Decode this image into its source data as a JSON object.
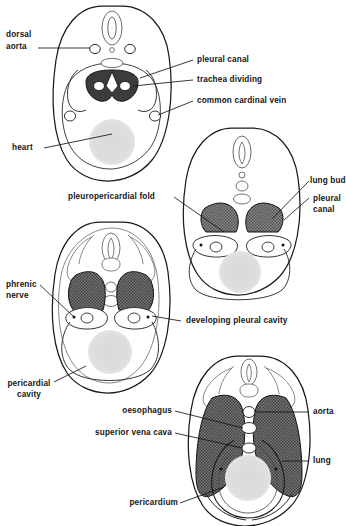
{
  "figure": {
    "type": "anatomical-diagram",
    "panels": [
      {
        "id": "panel-1",
        "name": "early-embryo-section"
      },
      {
        "id": "panel-2",
        "name": "lung-bud-section"
      },
      {
        "id": "panel-3",
        "name": "pleuropericardial-fold-section"
      },
      {
        "id": "panel-4",
        "name": "mature-pericardium-section"
      }
    ]
  },
  "labels": {
    "dorsal_aorta": "dorsal\naorta",
    "dorsal_aorta_l1": "dorsal",
    "dorsal_aorta_l2": "aorta",
    "pleural_canal": "pleural canal",
    "trachea_dividing": "trachea dividing",
    "common_cardinal_vein": "common cardinal vein",
    "heart": "heart",
    "pleuropericardial_fold": "pleuropericardial fold",
    "lung_bud": "lung bud",
    "pleural_canal_2_l1": "pleural",
    "pleural_canal_2_l2": "canal",
    "phrenic_nerve_l1": "phrenic",
    "phrenic_nerve_l2": "nerve",
    "developing_pleural_cavity": "developing pleural cavity",
    "pericardial_cavity_l1": "pericardial",
    "pericardial_cavity_l2": "cavity",
    "oesophagus": "oesophagus",
    "superior_vena_cava": "superior vena cava",
    "aorta": "aorta",
    "lung": "lung",
    "pericardium": "pericardium"
  },
  "colors": {
    "outline": "#1a1a1a",
    "thin_outline": "#4a4a4a",
    "shaded_cavity": "#6e6e6e",
    "heart_fill": "#dcdcdc",
    "trachea_dark": "#3a3a3a",
    "background": "#ffffff",
    "text": "#151515"
  },
  "caption": ""
}
